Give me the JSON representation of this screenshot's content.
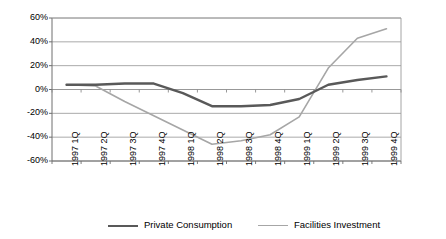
{
  "chart_data": {
    "type": "line",
    "title": "",
    "xlabel": "",
    "ylabel": "",
    "ylim": [
      -60,
      60
    ],
    "ytick_step": 20,
    "grid": true,
    "legend_position": "bottom",
    "categories": [
      "1997 1Q",
      "1997 2Q",
      "1997 3Q",
      "1997 4Q",
      "1998 1Q",
      "1998 2Q",
      "1998 3Q",
      "1998 4Q",
      "1999 1Q",
      "1999 2Q",
      "1999 3Q",
      "1999 4Q"
    ],
    "ytick_labels": [
      "60%",
      "40%",
      "20%",
      "0%",
      "-20%",
      "-40%",
      "-60%"
    ],
    "ytick_values": [
      60,
      40,
      20,
      0,
      -20,
      -40,
      -60
    ],
    "series": [
      {
        "name": "Private Consumption",
        "color": "#595959",
        "width": 2.4,
        "values": [
          4,
          4,
          5,
          5,
          -3,
          -14,
          -14,
          -13,
          -8,
          4,
          8,
          11
        ]
      },
      {
        "name": "Facilities Investment",
        "color": "#a6a6a6",
        "width": 1.6,
        "values": [
          4,
          3,
          -10,
          -22,
          -34,
          -46,
          -43,
          -38,
          -23,
          18,
          43,
          51
        ]
      }
    ]
  },
  "legend": {
    "items": [
      {
        "label": "Private Consumption",
        "color": "#595959",
        "width": 2.4
      },
      {
        "label": "Facilities Investment",
        "color": "#a6a6a6",
        "width": 1.6
      }
    ]
  },
  "axes": {
    "plot_left": 52,
    "plot_right": 401,
    "plot_top": 18,
    "plot_bottom": 161,
    "axis_color": "#808080",
    "grid_color": "#a0a0a0"
  }
}
